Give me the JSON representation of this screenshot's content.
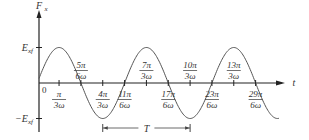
{
  "chart_data": {
    "type": "line",
    "title": "",
    "function": "F_x = E_xf * sin(ωt + π/6)",
    "xlabel": "t",
    "ylabel": "F_x",
    "y_ticks": [
      {
        "label": "E_xf",
        "value": 1
      },
      {
        "label": "−E_xf",
        "value": -1
      }
    ],
    "origin_label": "0",
    "x_ticks_below": [
      {
        "num": "π",
        "den": "3ω",
        "units": 2
      },
      {
        "num": "4π",
        "den": "3ω",
        "units": 8
      },
      {
        "num": "11π",
        "den": "6ω",
        "units": 11
      },
      {
        "num": "17π",
        "den": "6ω",
        "units": 17
      },
      {
        "num": "23π",
        "den": "6ω",
        "units": 23
      },
      {
        "num": "29π",
        "den": "6ω",
        "units": 29
      }
    ],
    "x_ticks_above": [
      {
        "num": "5π",
        "den": "6ω",
        "units": 5
      },
      {
        "num": "7π",
        "den": "3ω",
        "units": 14
      },
      {
        "num": "10π",
        "den": "3ω",
        "units": 20
      },
      {
        "num": "13π",
        "den": "3ω",
        "units": 26
      }
    ],
    "period": {
      "label": "T",
      "from_units": 8,
      "to_units": 20
    },
    "unit_note": "1 unit = π/(6ω)",
    "grid": false,
    "legend": null
  }
}
